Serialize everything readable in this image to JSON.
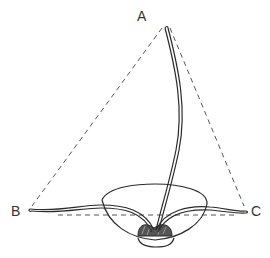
{
  "diagram": {
    "labels": {
      "a": "A",
      "b": "B",
      "c": "C"
    },
    "colors": {
      "stroke": "#2a2a2a",
      "dashed": "#555555",
      "background": "#ffffff"
    },
    "elements": [
      "dashed-triangle",
      "long-stem-to-A",
      "left-leaf-to-B",
      "right-leaf-to-C",
      "bowl",
      "seed-bulb"
    ]
  }
}
